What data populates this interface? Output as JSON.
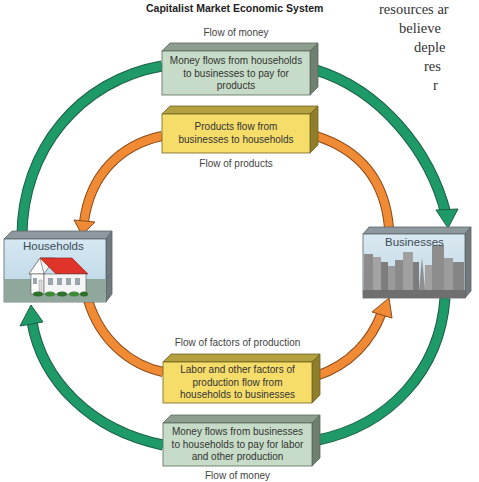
{
  "side_text_fragment": [
    "resources ar",
    "believe",
    "deple",
    "res",
    "r"
  ],
  "colors": {
    "money_arrow": "#1e9a68",
    "product_arrow": "#f08a35",
    "money_box_front": "#c7dcc8",
    "money_box_top": "#8d9e8e",
    "money_box_side": "#6f7f70",
    "product_box_front": "#f6dd6a",
    "product_box_top": "#b3a13f",
    "product_box_side": "#8f7f2a"
  },
  "nodes": {
    "households": {
      "label": "Households",
      "icon": "house-icon"
    },
    "businesses": {
      "label": "Businesses",
      "icon": "city-skyline-icon"
    }
  },
  "flows": {
    "top_money": {
      "caption": "Flow of money",
      "lines": [
        "Money flows from households",
        "to businesses to pay for",
        "products"
      ]
    },
    "top_products": {
      "caption": "Flow of products",
      "lines": [
        "Products flow from",
        "businesses to households"
      ]
    },
    "bottom_factors": {
      "caption": "Flow of factors of production",
      "lines": [
        "Labor and other factors of",
        "production flow from",
        "households to businesses"
      ]
    },
    "bottom_money": {
      "caption": "Flow of money",
      "lines": [
        "Money flows from businesses",
        "to households to pay for labor",
        "and other production"
      ]
    }
  }
}
